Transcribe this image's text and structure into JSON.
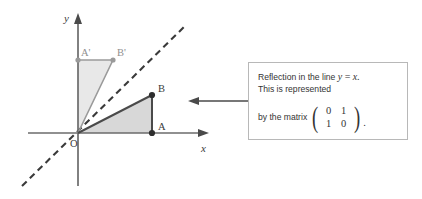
{
  "figure": {
    "kind": "geometry-transformation-diagram",
    "background_color": "#ffffff",
    "axes": {
      "x_label": "x",
      "y_label": "y",
      "origin_label": "O",
      "axis_color": "#6b6b6b"
    },
    "mirror_line": {
      "equation": "y = x",
      "style": "dashed",
      "color": "#3a3a3a"
    },
    "object_triangle": {
      "name": "OAB",
      "fill": "#d8d8d8",
      "stroke": "#4a4a4a",
      "vertices": [
        {
          "label": "O",
          "x": 0,
          "y": 0
        },
        {
          "label": "A",
          "x": 3,
          "y": 0
        },
        {
          "label": "B",
          "x": 3,
          "y": 2
        }
      ]
    },
    "image_triangle": {
      "name": "OA'B'",
      "fill": "#e8e8e8",
      "stroke": "#9a9a9a",
      "vertices": [
        {
          "label": "O",
          "x": 0,
          "y": 0
        },
        {
          "label": "A'",
          "x": 0,
          "y": 3
        },
        {
          "label": "B'",
          "x": 2,
          "y": 3
        }
      ]
    },
    "connector_arrow": {
      "direction": "left",
      "color": "#4a4a4a"
    }
  },
  "callout": {
    "line1_prefix": "Reflection in the line",
    "line1_equation_y": "y",
    "line1_equation_eq": "=",
    "line1_equation_x": "x",
    "line1_suffix": ".",
    "line2": "This is represented",
    "line3_prefix": "by the matrix",
    "matrix": [
      [
        "0",
        "1"
      ],
      [
        "1",
        "0"
      ]
    ],
    "left_paren": "(",
    "right_paren": ")",
    "trailing_period": ".",
    "border_color": "#b8b8b8",
    "background_color": "#ffffff",
    "text_color": "#333333"
  }
}
